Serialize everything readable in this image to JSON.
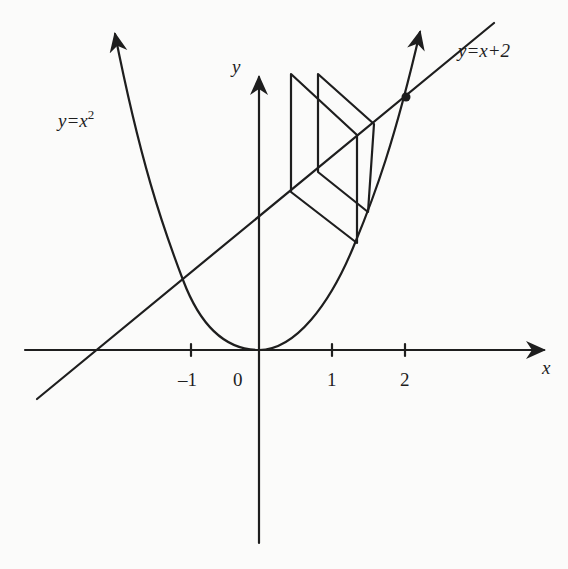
{
  "diagram": {
    "stroke_color": "#1e1e1e",
    "background": "#fbfbfa",
    "axes": {
      "x_label": "x",
      "y_label": "y",
      "x_ticks": [
        {
          "value": -1,
          "label": "–1"
        },
        {
          "value": 1,
          "label": "1"
        },
        {
          "value": 2,
          "label": "2"
        }
      ],
      "origin_label": "0"
    },
    "curves": [
      {
        "name": "parabola",
        "equation": "y=x^2",
        "label_base": "y=x",
        "label_exp": "2"
      },
      {
        "name": "line",
        "equation": "y=x+2",
        "label": "y=x+2"
      }
    ],
    "intersection_point": {
      "x": 2,
      "y": 4,
      "marked": true
    },
    "cobweb_iterations": 2
  }
}
